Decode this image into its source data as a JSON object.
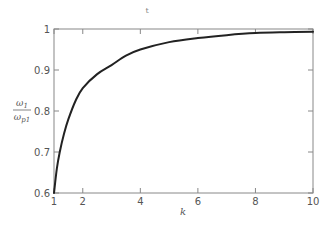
{
  "chart_data": {
    "type": "line",
    "title": "",
    "top_mark": "t",
    "xlabel": "k",
    "ylabel": "ω1 / ωp1",
    "ylabel_parts": {
      "numerator": "ω",
      "numerator_sub": "1",
      "denominator": "ω",
      "denominator_sub": "p1"
    },
    "xlim": [
      1,
      10
    ],
    "ylim": [
      0.6,
      1.0
    ],
    "x_ticks": [
      1,
      2,
      4,
      6,
      8,
      10
    ],
    "x_tick_labels": [
      "1",
      "2",
      "4",
      "6",
      "8",
      "10"
    ],
    "y_ticks": [
      0.6,
      0.7,
      0.8,
      0.9,
      1.0
    ],
    "y_tick_labels": [
      "0.6",
      "0.7",
      "0.8",
      "0.9",
      "1"
    ],
    "grid": false,
    "legend": null,
    "series": [
      {
        "name": "ω1/ωp1",
        "color": "#222222",
        "x": [
          1.0,
          1.1,
          1.2,
          1.35,
          1.5,
          1.75,
          2.0,
          2.5,
          3.0,
          3.5,
          4.0,
          5.0,
          6.0,
          7.0,
          8.0,
          9.0,
          10.0
        ],
        "y": [
          0.6,
          0.66,
          0.7,
          0.745,
          0.78,
          0.825,
          0.856,
          0.89,
          0.912,
          0.935,
          0.95,
          0.968,
          0.978,
          0.985,
          0.99,
          0.992,
          0.993
        ]
      }
    ]
  }
}
